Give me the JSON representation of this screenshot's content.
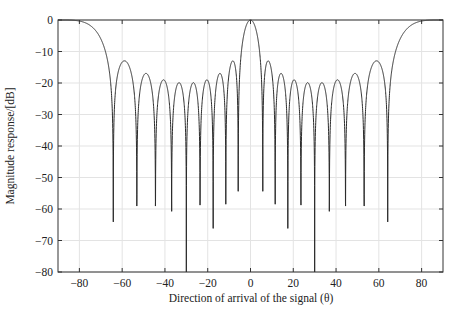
{
  "chart_data": {
    "type": "line",
    "title": "",
    "xlabel": "Direction of arrival of the signal (θ)",
    "ylabel": "Magnitude response/[dB]",
    "xlim": [
      -90,
      90
    ],
    "ylim": [
      -80,
      0
    ],
    "xticks": [
      -80,
      -60,
      -40,
      -20,
      0,
      20,
      40,
      60,
      80
    ],
    "yticks": [
      0,
      -10,
      -20,
      -30,
      -40,
      -50,
      -60,
      -70,
      -80
    ],
    "grid": true,
    "legend": null,
    "series": [
      {
        "name": "Array response",
        "model": {
          "description": "Uniform linear array factor |sin(N·π·(d/λ)·sinθ) / (N·sin(π·(d/λ)·sinθ))| in dB",
          "N": 10,
          "d_over_lambda": 1.0,
          "floor_db": -80
        },
        "main_lobe": {
          "theta": 0,
          "db": 0
        },
        "edge_lobes": [
          {
            "theta": -90,
            "db": 0
          },
          {
            "theta": 90,
            "db": 0
          }
        ],
        "sidelobe_peaks": [
          {
            "theta": -59.5,
            "db": -12.9
          },
          {
            "theta": -50.7,
            "db": -17.2
          },
          {
            "theta": -41.4,
            "db": -19.0
          },
          {
            "theta": -33.7,
            "db": -19.8
          },
          {
            "theta": -27.0,
            "db": -19.8
          },
          {
            "theta": -20.5,
            "db": -18.8
          },
          {
            "theta": -14.4,
            "db": -16.7
          },
          {
            "theta": -8.8,
            "db": -12.9
          },
          {
            "theta": 7.9,
            "db": -13.0
          },
          {
            "theta": 13.8,
            "db": -16.7
          },
          {
            "theta": 20.0,
            "db": -19.0
          },
          {
            "theta": 26.8,
            "db": -19.8
          },
          {
            "theta": 33.5,
            "db": -19.8
          },
          {
            "theta": 40.7,
            "db": -19.0
          },
          {
            "theta": 48.6,
            "db": -17.0
          },
          {
            "theta": 58.6,
            "db": -12.7
          }
        ],
        "nulls": [
          {
            "theta": -64.2,
            "db": -45
          },
          {
            "theta": -53.1,
            "db": -48.6
          },
          {
            "theta": -44.4,
            "db": -64
          },
          {
            "theta": -36.9,
            "db": -59.4
          },
          {
            "theta": -30.0,
            "db": -80
          },
          {
            "theta": -23.6,
            "db": -49.5
          },
          {
            "theta": -17.5,
            "db": -47
          },
          {
            "theta": -11.5,
            "db": -42
          },
          {
            "theta": -5.7,
            "db": -38.7
          },
          {
            "theta": 5.7,
            "db": -38.7
          },
          {
            "theta": 11.5,
            "db": -42
          },
          {
            "theta": 17.5,
            "db": -46.7
          },
          {
            "theta": 23.6,
            "db": -49.2
          },
          {
            "theta": 30.0,
            "db": -80
          },
          {
            "theta": 36.9,
            "db": -59.4
          },
          {
            "theta": 44.4,
            "db": -64
          },
          {
            "theta": 53.1,
            "db": -48.3
          },
          {
            "theta": 64.2,
            "db": -44.5
          }
        ]
      }
    ]
  },
  "style": {
    "line_color": "#2b2b2b",
    "grid_color": "#e3e3e3",
    "axis_color": "#333333"
  }
}
